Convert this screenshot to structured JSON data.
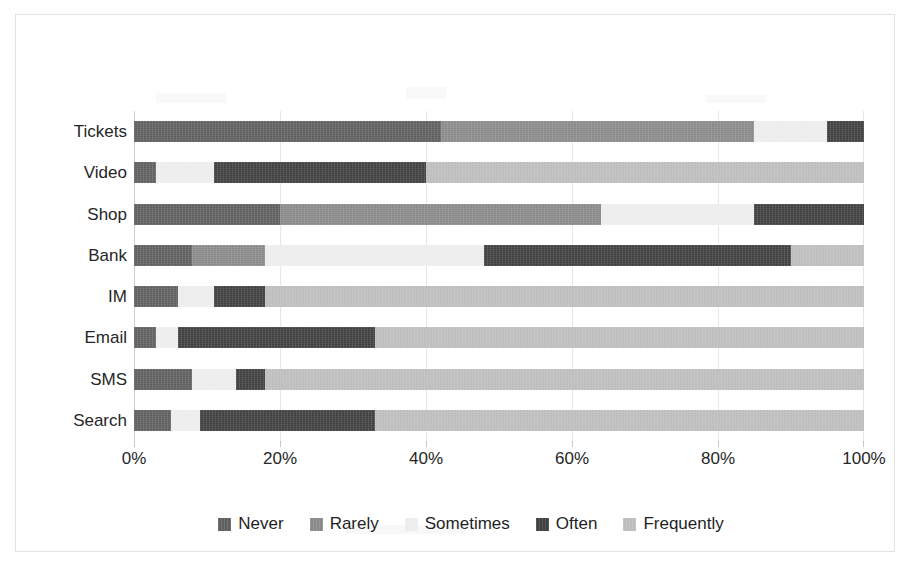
{
  "figure": {
    "background": "#ffffff",
    "frame_color": "#e2e2e2"
  },
  "axis": {
    "x_ticks": [
      "0%",
      "20%",
      "40%",
      "60%",
      "80%",
      "100%"
    ],
    "x_tick_values": [
      0,
      20,
      40,
      60,
      80,
      100
    ],
    "y_categories": [
      "Tickets",
      "Video",
      "Shop",
      "Bank",
      "IM",
      "Email",
      "SMS",
      "Search"
    ]
  },
  "legend": {
    "position": "bottom",
    "items": [
      {
        "label": "Never",
        "color": "#5f5f5f"
      },
      {
        "label": "Rarely",
        "color": "#8a8a8a"
      },
      {
        "label": "Sometimes",
        "color": "#ededed"
      },
      {
        "label": "Often",
        "color": "#404040"
      },
      {
        "label": "Frequently",
        "color": "#bdbdbd"
      }
    ]
  },
  "chart_data": {
    "type": "bar",
    "orientation": "horizontal",
    "stacked": true,
    "normalized_100pct": true,
    "title": "",
    "xlabel": "",
    "ylabel": "",
    "xlim": [
      0,
      100
    ],
    "grid": true,
    "x_tick_labels": [
      "0%",
      "20%",
      "40%",
      "60%",
      "80%",
      "100%"
    ],
    "categories": [
      "Tickets",
      "Video",
      "Shop",
      "Bank",
      "IM",
      "Email",
      "SMS",
      "Search"
    ],
    "series": [
      {
        "name": "Never",
        "color": "#5f5f5f",
        "values": [
          42,
          3,
          20,
          8,
          6,
          3,
          8,
          5
        ]
      },
      {
        "name": "Rarely",
        "color": "#8a8a8a",
        "values": [
          43,
          0,
          44,
          10,
          0,
          0,
          0,
          0
        ]
      },
      {
        "name": "Sometimes",
        "color": "#ededed",
        "values": [
          10,
          8,
          21,
          30,
          5,
          3,
          6,
          4
        ]
      },
      {
        "name": "Often",
        "color": "#404040",
        "values": [
          5,
          29,
          15,
          42,
          7,
          27,
          4,
          24
        ]
      },
      {
        "name": "Frequently",
        "color": "#bdbdbd",
        "values": [
          0,
          60,
          0,
          10,
          82,
          67,
          82,
          67
        ]
      }
    ],
    "stack_boundaries_percent": {
      "Tickets": [
        0,
        42,
        85,
        95,
        100,
        100
      ],
      "Video": [
        0,
        3,
        3,
        11,
        40,
        100
      ],
      "Shop": [
        0,
        20,
        64,
        85,
        100,
        100
      ],
      "Bank": [
        0,
        8,
        18,
        48,
        90,
        100
      ],
      "IM": [
        0,
        6,
        6,
        11,
        18,
        100
      ],
      "Email": [
        0,
        3,
        3,
        6,
        33,
        100
      ],
      "SMS": [
        0,
        8,
        8,
        14,
        18,
        100
      ],
      "Search": [
        0,
        5,
        5,
        9,
        33,
        100
      ]
    }
  }
}
